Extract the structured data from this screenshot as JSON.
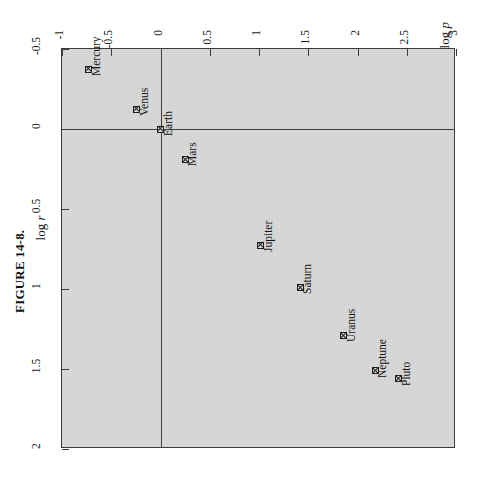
{
  "figure": {
    "caption": "FIGURE 14-8."
  },
  "chart_data": {
    "type": "scatter",
    "title": "",
    "xlabel": "log p",
    "ylabel": "log r",
    "xlim": [
      -1,
      3
    ],
    "ylim": [
      -0.5,
      2
    ],
    "y_axis_inverted": true,
    "grid": false,
    "legend": "none",
    "reference_lines": [
      {
        "axis": "x",
        "value": 0
      },
      {
        "axis": "y",
        "value": 0
      }
    ],
    "xticks": [
      "-1",
      "-0.5",
      "0",
      "0.5",
      "1",
      "1.5",
      "2",
      "2.5",
      "3"
    ],
    "xtick_values": [
      -1,
      -0.5,
      0,
      0.5,
      1,
      1.5,
      2,
      2.5,
      3
    ],
    "yticks": [
      "-0.5",
      "0",
      "0.5",
      "1",
      "1.5",
      "2"
    ],
    "ytick_values": [
      -0.5,
      0,
      0.5,
      1,
      1.5,
      2
    ],
    "point_labels": [
      "Mercury",
      "Venus",
      "Earth",
      "Mars",
      "Jupiter",
      "Saturn",
      "Uranus",
      "Neptune",
      "Pluto"
    ],
    "x": [
      -0.73,
      -0.24,
      0.0,
      0.25,
      1.02,
      1.42,
      1.86,
      2.18,
      2.42
    ],
    "y": [
      -0.375,
      -0.125,
      0.0,
      0.19,
      0.725,
      0.99,
      1.29,
      1.51,
      1.56
    ],
    "points": [
      {
        "label": "Mercury",
        "x": -0.73,
        "y": -0.375
      },
      {
        "label": "Venus",
        "x": -0.24,
        "y": -0.125
      },
      {
        "label": "Earth",
        "x": 0.0,
        "y": 0.0
      },
      {
        "label": "Mars",
        "x": 0.25,
        "y": 0.19
      },
      {
        "label": "Jupiter",
        "x": 1.02,
        "y": 0.725
      },
      {
        "label": "Saturn",
        "x": 1.42,
        "y": 0.99
      },
      {
        "label": "Uranus",
        "x": 1.86,
        "y": 1.29
      },
      {
        "label": "Neptune",
        "x": 2.18,
        "y": 1.51
      },
      {
        "label": "Pluto",
        "x": 2.42,
        "y": 1.56
      }
    ]
  },
  "colors": {
    "plot_background": "#d9d9d9",
    "page_background": "#ffffff",
    "ink": "#1a1a1a",
    "frame": "#3b3b3b"
  }
}
